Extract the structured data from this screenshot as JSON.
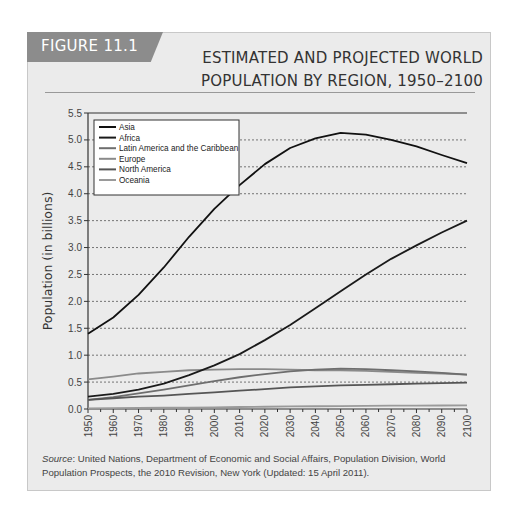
{
  "figure": {
    "tag": "FIGURE 11.1",
    "title_line1": "ESTIMATED AND PROJECTED WORLD",
    "title_line2": "POPULATION BY REGION, 1950–2100",
    "source_label": "Source",
    "source_text": ": United Nations, Department of Economic and Social Affairs, Population Division, World Population Prospects, the 2010 Revision, New York (Updated: 15 April 2011)."
  },
  "chart_data": {
    "type": "line",
    "title": "Estimated and Projected World Population by Region, 1950–2100",
    "xlabel": "",
    "ylabel": "Population (in billions)",
    "ylim": [
      0,
      5.5
    ],
    "xlim": [
      1950,
      2100
    ],
    "yticks": [
      "0.0",
      "0.5",
      "1.0",
      "1.5",
      "2.0",
      "2.5",
      "3.0",
      "3.5",
      "4.0",
      "4.5",
      "5.0",
      "5.5"
    ],
    "xticks": [
      "1950",
      "1960",
      "1970",
      "1980",
      "1990",
      "2000",
      "2010",
      "2020",
      "2030",
      "2040",
      "2050",
      "2060",
      "2070",
      "2080",
      "2090",
      "2100"
    ],
    "grid": "horizontal dashed",
    "legend_position": "upper left",
    "x": [
      1950,
      1960,
      1970,
      1980,
      1990,
      2000,
      2010,
      2020,
      2030,
      2040,
      2050,
      2060,
      2070,
      2080,
      2090,
      2100
    ],
    "series": [
      {
        "name": "Asia",
        "color": "#111111",
        "values": [
          1.4,
          1.7,
          2.12,
          2.63,
          3.2,
          3.72,
          4.16,
          4.55,
          4.85,
          5.03,
          5.13,
          5.1,
          5.0,
          4.88,
          4.72,
          4.57
        ]
      },
      {
        "name": "Africa",
        "color": "#1a1a1a",
        "values": [
          0.23,
          0.28,
          0.36,
          0.47,
          0.63,
          0.81,
          1.02,
          1.28,
          1.56,
          1.87,
          2.19,
          2.5,
          2.79,
          3.04,
          3.28,
          3.5
        ]
      },
      {
        "name": "Latin America and the Caribbean",
        "color": "#6e6e6e",
        "values": [
          0.17,
          0.22,
          0.29,
          0.36,
          0.44,
          0.52,
          0.59,
          0.65,
          0.7,
          0.73,
          0.75,
          0.74,
          0.72,
          0.7,
          0.67,
          0.64
        ]
      },
      {
        "name": "Europe",
        "color": "#8a8a8a",
        "values": [
          0.55,
          0.6,
          0.66,
          0.69,
          0.72,
          0.73,
          0.74,
          0.74,
          0.73,
          0.72,
          0.72,
          0.71,
          0.69,
          0.67,
          0.66,
          0.64
        ]
      },
      {
        "name": "North America",
        "color": "#555555",
        "values": [
          0.17,
          0.2,
          0.23,
          0.25,
          0.28,
          0.31,
          0.34,
          0.37,
          0.4,
          0.42,
          0.44,
          0.45,
          0.46,
          0.47,
          0.48,
          0.49
        ]
      },
      {
        "name": "Oceania",
        "color": "#9a9a9a",
        "values": [
          0.013,
          0.016,
          0.02,
          0.023,
          0.027,
          0.031,
          0.037,
          0.042,
          0.047,
          0.051,
          0.055,
          0.058,
          0.061,
          0.063,
          0.065,
          0.066
        ]
      }
    ]
  }
}
